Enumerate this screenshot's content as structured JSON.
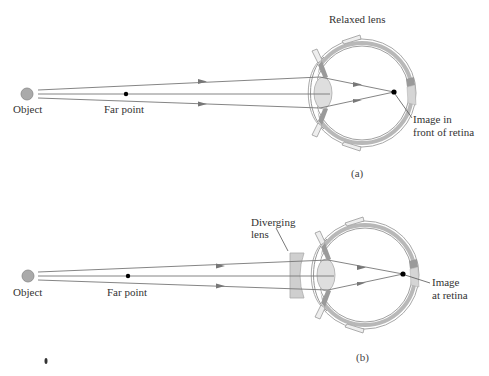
{
  "figure": {
    "panels": [
      {
        "id": "a",
        "caption": "(a)",
        "labels": {
          "object": "Object",
          "far_point": "Far point",
          "lens_state": "Relaxed lens",
          "image_line1": "Image in",
          "image_line2": "front of retina"
        }
      },
      {
        "id": "b",
        "caption": "(b)",
        "labels": {
          "object": "Object",
          "far_point": "Far point",
          "corrective_lens_line1": "Diverging",
          "corrective_lens_line2": "lens",
          "image_line1": "Image",
          "image_line2": "at retina"
        }
      }
    ]
  },
  "colors": {
    "ray": "#777777",
    "arrow": "#777777",
    "eye_outline": "#999999",
    "eye_band": "#b5b5b5",
    "lens_fill": "#dddddd",
    "diverging_lens_fill": "#cfcfcf",
    "object_fill": "#aaaaaa",
    "dot": "#000000"
  }
}
